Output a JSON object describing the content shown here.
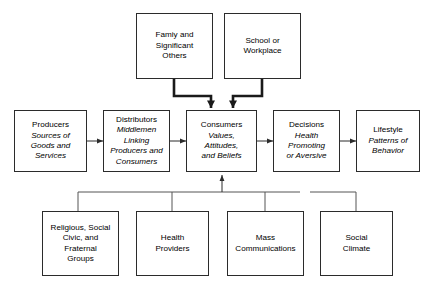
{
  "figure": {
    "kind": "flow-diagram",
    "background_color": "#ffffff",
    "line_color": "#2b2b2b",
    "text_color": "#000000"
  },
  "nodes": {
    "family": {
      "title": "Famiy and\nSignificant\nOthers",
      "subtitle": ""
    },
    "school": {
      "title": "School or\nWorkplace",
      "subtitle": ""
    },
    "producers": {
      "title": "Producers",
      "subtitle": "Sources of\nGoods and\nServices"
    },
    "distributors": {
      "title": "Distributors",
      "subtitle": "Middlemen\nLinking\nProducers and\nConsumers"
    },
    "consumers": {
      "title": "Consumers",
      "subtitle": "Values,\nAttitudes,\nand Beliefs"
    },
    "decisions": {
      "title": "Decisions",
      "subtitle": "Health\nPromoting\nor Aversive"
    },
    "lifestyle": {
      "title": "Lifestyle",
      "subtitle": "Patterns of\nBehavior"
    },
    "religious": {
      "title": "Religious, Social\nCivic, and\nFraternal\nGroups",
      "subtitle": ""
    },
    "health_providers": {
      "title": "Health\nProviders",
      "subtitle": ""
    },
    "mass_comm": {
      "title": "Mass\nCommunications",
      "subtitle": ""
    },
    "social_climate": {
      "title": "Social\nClimate",
      "subtitle": ""
    }
  }
}
